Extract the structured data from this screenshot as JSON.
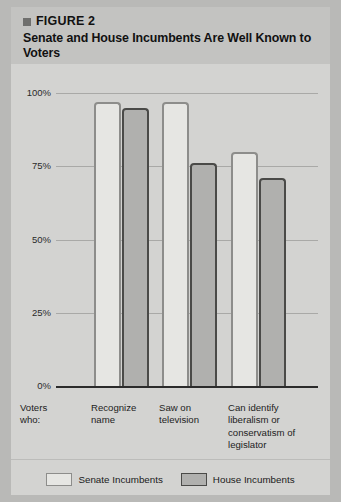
{
  "figure": {
    "bullet_icon": "square-bullet-icon",
    "kicker": "FIGURE 2",
    "title": "Senate and House Incumbents Are Well Known to Voters",
    "axis_intro_label": "Voters who:"
  },
  "legend": {
    "entries": [
      {
        "label": "Senate Incumbents",
        "swatch_icon": "legend-swatch-senate",
        "color": "#e6e6e3",
        "border_color": "#8d8d8b"
      },
      {
        "label": "House Incumbents",
        "swatch_icon": "legend-swatch-house",
        "color": "#b0b0ae",
        "border_color": "#4a4a48"
      }
    ]
  },
  "chart_data": {
    "type": "bar",
    "title": "Senate and House Incumbents Are Well Known to Voters",
    "subtitle": "FIGURE 2",
    "xlabel": "Voters who:",
    "ylabel": "",
    "ylim": [
      0,
      100
    ],
    "yticks": [
      0,
      25,
      50,
      75,
      100
    ],
    "ytick_labels": [
      "0%",
      "25%",
      "50%",
      "75%",
      "100%"
    ],
    "grid": true,
    "legend_position": "bottom",
    "categories": [
      "Recognize name",
      "Saw on television",
      "Can identify liberalism or conservatism of legislator"
    ],
    "series": [
      {
        "name": "Senate Incumbents",
        "values": [
          97,
          97,
          80
        ],
        "color": "#e6e6e3",
        "border_color": "#8d8d8b"
      },
      {
        "name": "House Incumbents",
        "values": [
          95,
          76,
          71
        ],
        "color": "#b0b0ae",
        "border_color": "#4a4a48"
      }
    ]
  }
}
